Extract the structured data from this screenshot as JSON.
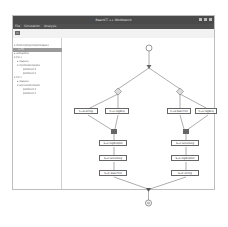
{
  "window": {
    "title": "ReactCT ++ Workbench",
    "menu": [
      "File",
      "Simulation",
      "Analysis"
    ]
  },
  "toolbar": {
    "icons": [
      "folder-icon"
    ]
  },
  "sidebar": {
    "items": [
      {
        "label": "▾ /home/project/workspace",
        "indent": 0,
        "selected": false
      },
      {
        "label": "a.rdl",
        "indent": 4,
        "selected": true
      },
      {
        "label": "▸ semantics",
        "indent": 1,
        "selected": false
      },
      {
        "label": "▾ C1 ()",
        "indent": 1,
        "selected": false
      },
      {
        "label": "▸ classes",
        "indent": 3,
        "selected": false
      },
      {
        "label": "▾ clientextensions",
        "indent": 3,
        "selected": false
      },
      {
        "label": "pointcut 1",
        "indent": 9,
        "selected": false
      },
      {
        "label": "pointcut 2",
        "indent": 9,
        "selected": false
      },
      {
        "label": "▾ C2 ()",
        "indent": 1,
        "selected": false
      },
      {
        "label": "▸ classes",
        "indent": 3,
        "selected": false
      },
      {
        "label": "▾ serverextension",
        "indent": 3,
        "selected": false
      },
      {
        "label": "pointcut 1",
        "indent": 9,
        "selected": false
      },
      {
        "label": "pointcut 2",
        "indent": 9,
        "selected": false
      }
    ]
  },
  "diagram": {
    "row1": [
      "C→S:string",
      "C→L:logReq",
      "C→S:dateFmt",
      "C→L:logReq"
    ],
    "row2": [
      "S→L:logReqExt",
      "S→L:latestLog"
    ],
    "row3": [
      "S→L:latestLog",
      "S→L:logReqExt"
    ],
    "row4": [
      "S→C:dateFmt",
      "S→C:string"
    ]
  }
}
